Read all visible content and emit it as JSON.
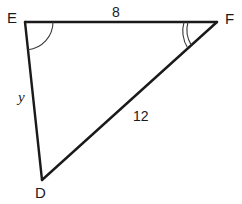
{
  "figure": {
    "kind": "triangle-diagram",
    "shape_name": "triangle-DEF",
    "background_color": "#ffffff",
    "stroke_color": "#1a1a1a",
    "stroke_width": 2,
    "width": 242,
    "height": 204
  },
  "vertices": [
    {
      "id": "E",
      "label": "E",
      "x": 25,
      "y": 22
    },
    {
      "id": "F",
      "label": "F",
      "x": 217,
      "y": 22
    },
    {
      "id": "D",
      "label": "D",
      "x": 42,
      "y": 180
    }
  ],
  "sides": [
    {
      "id": "EF",
      "from": "E",
      "to": "F",
      "label": "8",
      "label_kind": "number"
    },
    {
      "id": "DF",
      "from": "D",
      "to": "F",
      "label": "12",
      "label_kind": "number"
    },
    {
      "id": "ED",
      "from": "E",
      "to": "D",
      "label": "y",
      "label_kind": "variable"
    }
  ],
  "angle_marks": [
    {
      "at": "E",
      "arcs": 1,
      "radius": 26
    },
    {
      "at": "F",
      "arcs": 2,
      "radius": 30
    }
  ]
}
